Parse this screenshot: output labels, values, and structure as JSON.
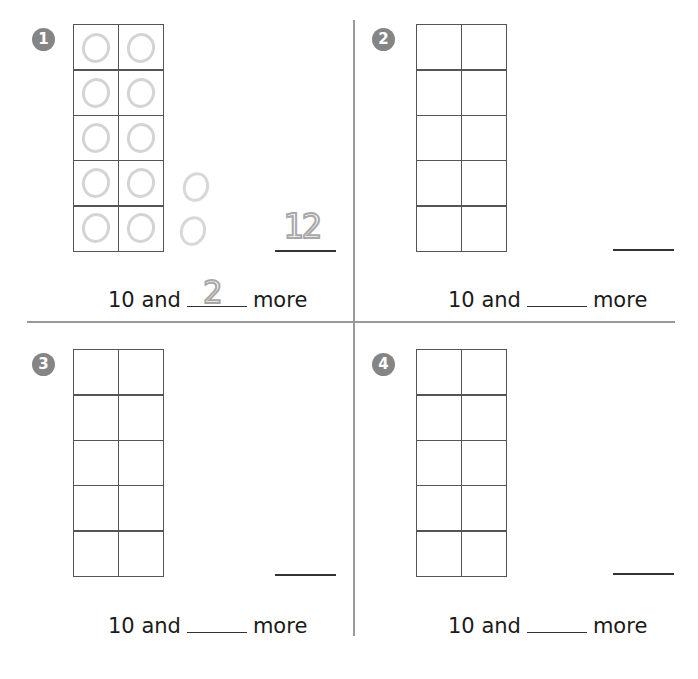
{
  "worksheet": {
    "sentence_prefix": "10 and",
    "sentence_suffix": "more",
    "colors": {
      "badge": "#858585",
      "grid": "#555555",
      "counter": "#d4d4d4",
      "traced": "#a8a8a8",
      "divider": "#9a9a9a"
    },
    "problems": [
      {
        "number": "1",
        "frame_filled": 10,
        "extra_counters": 2,
        "total_answer": "12",
        "more_answer": "2"
      },
      {
        "number": "2",
        "frame_filled": 0,
        "extra_counters": 0,
        "total_answer": "",
        "more_answer": ""
      },
      {
        "number": "3",
        "frame_filled": 0,
        "extra_counters": 0,
        "total_answer": "",
        "more_answer": ""
      },
      {
        "number": "4",
        "frame_filled": 0,
        "extra_counters": 0,
        "total_answer": "",
        "more_answer": ""
      }
    ]
  }
}
